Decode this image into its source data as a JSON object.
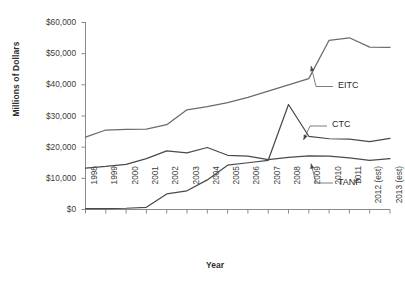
{
  "chart_data": {
    "type": "line",
    "title": "",
    "xlabel": "Year",
    "ylabel": "Millions of Dollars",
    "ylim": [
      0,
      60000
    ],
    "ytick_labels": [
      "$60,000",
      "$50,000",
      "$40,000",
      "$30,000",
      "$20,000",
      "$10,000",
      "$0"
    ],
    "ytick_values": [
      60000,
      50000,
      40000,
      30000,
      20000,
      10000,
      0
    ],
    "grid": false,
    "legend_position": "inline-annotations",
    "categories": [
      "1998",
      "1999",
      "2000",
      "2001",
      "2002",
      "2003",
      "2004",
      "2005",
      "2006",
      "2007",
      "2008",
      "2009",
      "2010",
      "2011",
      "2012 (est)",
      "2013 (est)"
    ],
    "series": [
      {
        "name": "EITC",
        "color": "#6b6b6b",
        "values": [
          23200,
          25500,
          25700,
          25800,
          27200,
          32000,
          33000,
          34300,
          36000,
          38000,
          40000,
          42000,
          54300,
          55100,
          52100,
          52000
        ]
      },
      {
        "name": "CTC",
        "color": "#4a4a4a",
        "values": [
          300,
          300,
          400,
          700,
          5000,
          6000,
          9500,
          14200,
          15000,
          15800,
          33700,
          23500,
          22700,
          22600,
          21800,
          22800
        ]
      },
      {
        "name": "TANF",
        "color": "#4a4a4a",
        "values": [
          13300,
          13800,
          14500,
          16300,
          18800,
          18200,
          19900,
          17400,
          17100,
          16000,
          16700,
          17200,
          17100,
          16600,
          15800,
          16300
        ]
      }
    ],
    "annotations": [
      {
        "label": "EITC",
        "target_year": "2010",
        "target_value": 47000
      },
      {
        "label": "CTC",
        "target_year": "2009",
        "target_value": 23500
      },
      {
        "label": "TANF",
        "target_year": "2010",
        "target_value": 17100
      }
    ]
  }
}
